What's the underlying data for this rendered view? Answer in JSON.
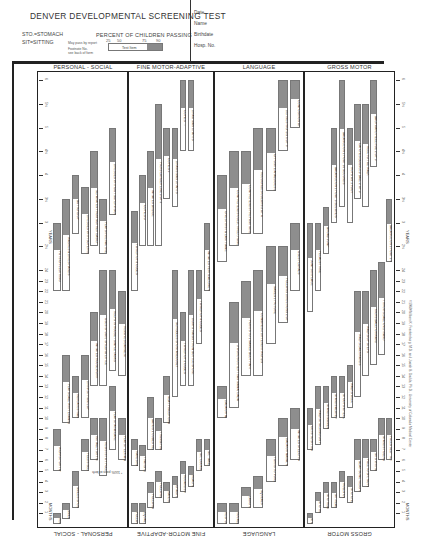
{
  "header": {
    "title": "DENVER DEVELOPMENTAL SCREENING TEST",
    "abbreviations": [
      "STO.=STOMACH",
      "SIT=SITTING"
    ],
    "percent_title": "PERCENT OF CHILDREN PASSING",
    "percent_ticks": [
      "25",
      "50",
      "75",
      "90"
    ],
    "legend_notes": [
      "May pass by report",
      "Footnote No.",
      "see back of form"
    ],
    "legend_item_label": "Test Item",
    "meta_fields": [
      "Date",
      "Name",
      "Birthdate",
      "Hosp. No."
    ]
  },
  "sections": [
    {
      "id": "personal-social",
      "label": "PERSONAL - SOCIAL"
    },
    {
      "id": "fine-motor-adaptive",
      "label": "FINE MOTOR-ADAPTIVE"
    },
    {
      "id": "language",
      "label": "LANGUAGE"
    },
    {
      "id": "gross-motor",
      "label": "GROSS MOTOR"
    }
  ],
  "axis": {
    "months_label": "MONTHS",
    "years_label": "YEARS",
    "ticks": [
      "1",
      "2",
      "3",
      "4",
      "5",
      "6",
      "7",
      "8",
      "9",
      "10",
      "11",
      "12",
      "13",
      "14",
      "15",
      "16",
      "17",
      "18",
      "19",
      "20",
      "21",
      "22",
      "23",
      "24",
      "2½",
      "3",
      "3½",
      "4",
      "4½",
      "5",
      "5½",
      "6"
    ]
  },
  "footnotes": {
    "ps_note": "* 100% pass at birth",
    "copyright": "©1969 William K. Frankenburg, M.D. and Josiah B. Dodds, Ph.D., University of Colorado Medical Center"
  },
  "colors": {
    "bar_fill": "#8e8e8e",
    "bar_border": "#777777",
    "rule": "#222222",
    "paper": "#ffffff"
  },
  "chart_data": {
    "type": "bar",
    "title": "DENVER DEVELOPMENTAL SCREENING TEST",
    "orientation": "rotated; age axis runs bottom (birth) to top (6 years)",
    "xlabel": "Age (months / years)",
    "ylabel": "Percent of children passing (25, 50, 75, 90)",
    "age_range_months": [
      0,
      72
    ],
    "series": [
      {
        "name": "PERSONAL-SOCIAL",
        "items": [
          {
            "label": "REGARDS FACE",
            "start": 0,
            "p90": 1
          },
          {
            "label": "SMILES RESPONSIVELY",
            "start": 0.5,
            "p90": 2
          },
          {
            "label": "SMILES SPONTANEOUSLY",
            "start": 1.5,
            "p90": 5
          },
          {
            "label": "FEEDS SELF CRACKERS",
            "start": 5,
            "p90": 8
          },
          {
            "label": "INITIALLY SHY WITH STRANGERS",
            "start": 6,
            "p90": 10
          },
          {
            "label": "RESISTS TOY PULL",
            "start": 4.5,
            "p90": 10
          },
          {
            "label": "PLAYS PAT-A-CAKE",
            "start": 7,
            "p90": 13
          },
          {
            "label": "PLAYS PEEK-A-BOO",
            "start": 6,
            "p90": 10
          },
          {
            "label": "WORKS FOR TOY OUT OF REACH",
            "start": 5,
            "p90": 9
          },
          {
            "label": "PLAYS BALL WITH EXAMINER",
            "start": 9.5,
            "p90": 16
          },
          {
            "label": "INDICATES WANTS (NOT CRY)",
            "start": 10,
            "p90": 14
          },
          {
            "label": "DRINKS FROM CUP",
            "start": 10,
            "p90": 16
          },
          {
            "label": "IMITATES HOUSEWORK",
            "start": 13,
            "p90": 20
          },
          {
            "label": "USES SPOON, SPILLING LITTLE",
            "start": 13,
            "p90": 24
          },
          {
            "label": "HELPS IN HOUSE - SIMPLE TASKS",
            "start": 14.5,
            "p90": 24
          },
          {
            "label": "REMOVES GARMENT",
            "start": 14,
            "p90": 22
          },
          {
            "label": "PUTS ON CLOTHING",
            "start": 22,
            "p90": 36
          },
          {
            "label": "WASHES & DRIES HANDS",
            "start": 22,
            "p90": 42
          },
          {
            "label": "BUTTONS UP",
            "start": 33,
            "p90": 48
          },
          {
            "label": "DRESSES WITH SUPERVISION",
            "start": 28,
            "p90": 45
          },
          {
            "label": "SEPARATES FROM MOTHER EASILY",
            "start": 30,
            "p90": 54
          },
          {
            "label": "PLAYS INTERACTIVE GAMES I.E. TAG",
            "start": 28,
            "p90": 42
          },
          {
            "label": "DRESSES WITHOUT SUPERVISION",
            "start": 38,
            "p90": 60
          }
        ]
      },
      {
        "name": "FINE MOTOR-ADAPTIVE",
        "items": [
          {
            "label": "FOLLOWS TO MIDLINE",
            "start": 0,
            "p90": 2
          },
          {
            "label": "EQUAL MOVEMENTS",
            "start": 0,
            "p90": 2
          },
          {
            "label": "FOLLOWS PAST MIDLINE",
            "start": 1.5,
            "p90": 4
          },
          {
            "label": "FOLLOWS 180°",
            "start": 2.5,
            "p90": 5
          },
          {
            "label": "HANDS TOGETHER",
            "start": 2,
            "p90": 4
          },
          {
            "label": "GRASPS RATTLE",
            "start": 2.5,
            "p90": 4.5
          },
          {
            "label": "REGARDS RAISIN",
            "start": 3,
            "p90": 6
          },
          {
            "label": "REACHES FOR OBJECT",
            "start": 3.5,
            "p90": 5.5
          },
          {
            "label": "SIT, LOOKS FOR YARN",
            "start": 5,
            "p90": 8
          },
          {
            "label": "SIT, TAKES 2 CUBES",
            "start": 5.5,
            "p90": 8
          },
          {
            "label": "RAKES RAISIN, ATTAINS",
            "start": 5.5,
            "p90": 8
          },
          {
            "label": "TRANSFERS CUBE HAND TO HAND",
            "start": 5,
            "p90": 7.5
          },
          {
            "label": "BANGS 2 CUBES HELD IN HANDS",
            "start": 7,
            "p90": 12
          },
          {
            "label": "THUMB-FINGER GRASP",
            "start": 7,
            "p90": 10
          },
          {
            "label": "NEAT PINCER GRASP OF RAISIN",
            "start": 9.5,
            "p90": 14
          },
          {
            "label": "SCRIBBLES SPONTANEOUSLY",
            "start": 12,
            "p90": 24
          },
          {
            "label": "TOWER OF 2 CUBES",
            "start": 13,
            "p90": 20
          },
          {
            "label": "DUMPS RAISIN FROM BOTTLE-SPONT.",
            "start": 13,
            "p90": 24
          },
          {
            "label": "TOWER OF 4 CUBES",
            "start": 17,
            "p90": 24
          },
          {
            "label": "IMITATES VERTICAL LINE WITHIN 30°",
            "start": 22,
            "p90": 36
          },
          {
            "label": "TOWER OF 8 CUBES",
            "start": 22,
            "p90": 39
          },
          {
            "label": "COPIES O",
            "start": 30,
            "p90": 48
          },
          {
            "label": "IMITATES BRIDGE",
            "start": 30,
            "p90": 54
          },
          {
            "label": "PICKS LONGER LINE 3 OF 3",
            "start": 30,
            "p90": 66
          },
          {
            "label": "COPIES +",
            "start": 42,
            "p90": 60
          },
          {
            "label": "DRAWS MAN 3 PARTS",
            "start": 40,
            "p90": 60
          },
          {
            "label": "COPIES □",
            "start": 54,
            "p90": 72
          },
          {
            "label": "DRAW MAN 6 PARTS",
            "start": 54,
            "p90": 72
          }
        ]
      },
      {
        "name": "LANGUAGE",
        "items": [
          {
            "label": "RESPONDS TO BELL",
            "start": 0,
            "p90": 2
          },
          {
            "label": "VOCALIZES, NOT CRYING",
            "start": 0,
            "p90": 2
          },
          {
            "label": "LAUGHS",
            "start": 1.5,
            "p90": 3.5
          },
          {
            "label": "SQUEALS",
            "start": 1.5,
            "p90": 4.5
          },
          {
            "label": "TURNS TO VOICE",
            "start": 4,
            "p90": 8
          },
          {
            "label": "DADA OR MAMA, NONSPECIFIC",
            "start": 5.5,
            "p90": 10
          },
          {
            "label": "IMITATES SPEECH SOUNDS",
            "start": 6,
            "p90": 11
          },
          {
            "label": "DADA OR MAMA, SPECIFIC",
            "start": 10,
            "p90": 13
          },
          {
            "label": "3 WORDS OTHER THAN MAMA, DADA",
            "start": 11,
            "p90": 21
          },
          {
            "label": "POINTS TO 1 NAMED BODY PART",
            "start": 14,
            "p90": 23
          },
          {
            "label": "COMBINES 2 DIFFERENT WORDS",
            "start": 14,
            "p90": 24
          },
          {
            "label": "NAMES 1 PICTURE",
            "start": 17,
            "p90": 30
          },
          {
            "label": "FOLLOWS DIRECTIONS 2 OF 3",
            "start": 19,
            "p90": 30
          },
          {
            "label": "USES PLURALS",
            "start": 22,
            "p90": 36
          },
          {
            "label": "GIVES FIRST & LAST NAME",
            "start": 26,
            "p90": 48
          },
          {
            "label": "COMPREHENDS COLD, TIRED, HUNGRY",
            "start": 30,
            "p90": 54
          },
          {
            "label": "COMPREHENDS PREPOSITIONS",
            "start": 33,
            "p90": 54
          },
          {
            "label": "RECOGNIZES COLORS 3 OF 4",
            "start": 33,
            "p90": 60
          },
          {
            "label": "OPPOSITE ANALOGIES 2 OF 3",
            "start": 44,
            "p90": 60
          },
          {
            "label": "DEFINES WORDS 6 OF 9",
            "start": 54,
            "p90": 72
          },
          {
            "label": "COMPOSITION OF 3 OF 3",
            "start": 60,
            "p90": 72
          }
        ]
      },
      {
        "name": "GROSS MOTOR",
        "items": [
          {
            "label": "STO. LIFTS HEAD",
            "start": 0,
            "p90": 1
          },
          {
            "label": "STO. HEAD UP 45°",
            "start": 1,
            "p90": 3
          },
          {
            "label": "STO. HEAD UP 90°",
            "start": 1.5,
            "p90": 4
          },
          {
            "label": "SIT-HEAD STEADY",
            "start": 1.5,
            "p90": 4
          },
          {
            "label": "ROLLS OVER",
            "start": 2.5,
            "p90": 5
          },
          {
            "label": "STO. CHEST UP-ARM SUPPORT",
            "start": 2,
            "p90": 4.5
          },
          {
            "label": "BEAR SOME WEIGHT ON LEGS",
            "start": 3,
            "p90": 8
          },
          {
            "label": "PULL TO SIT, NO HEAD LAG",
            "start": 3.5,
            "p90": 8
          },
          {
            "label": "SITS WITHOUT SUPPORT",
            "start": 5,
            "p90": 8
          },
          {
            "label": "STANDS HOLDING ON",
            "start": 6,
            "p90": 10
          },
          {
            "label": "PULLS SELF TO STAND",
            "start": 6,
            "p90": 10
          },
          {
            "label": "GETS TO SITTING",
            "start": 7,
            "p90": 11
          },
          {
            "label": "WALKS HOLDING ON FURNITURE",
            "start": 7.5,
            "p90": 13
          },
          {
            "label": "STANDS MOMENTARILY",
            "start": 9,
            "p90": 13
          },
          {
            "label": "STANDS ALONE WELL",
            "start": 10,
            "p90": 14
          },
          {
            "label": "STOOPS & RECOVERS",
            "start": 10,
            "p90": 14
          },
          {
            "label": "WALKS WELL",
            "start": 11,
            "p90": 15
          },
          {
            "label": "WALKS BACKWARDS",
            "start": 12,
            "p90": 22
          },
          {
            "label": "WALKS UP STEPS",
            "start": 14,
            "p90": 22
          },
          {
            "label": "KICKS BALL FORWARD",
            "start": 15,
            "p90": 24
          },
          {
            "label": "THROWS BALL OVERHAND",
            "start": 16,
            "p90": 26
          },
          {
            "label": "BALANCE ON 1 FOOT 1 SECOND",
            "start": 26,
            "p90": 42
          },
          {
            "label": "JUMPS IN PLACE",
            "start": 20,
            "p90": 36
          },
          {
            "label": "PEDALS TRIKE",
            "start": 22,
            "p90": 36
          },
          {
            "label": "BROAD JUMP",
            "start": 28,
            "p90": 40
          },
          {
            "label": "BALANCE ON 1 FOOT 5 SECONDS",
            "start": 36,
            "p90": 60
          },
          {
            "label": "BALANCE ON 1 FOOT 10 SECONDS",
            "start": 40,
            "p90": 72
          },
          {
            "label": "HOPS ON 1 FOOT",
            "start": 36,
            "p90": 60
          },
          {
            "label": "CATCHES BOUNCED BALL 2 OF 3",
            "start": 42,
            "p90": 66
          },
          {
            "label": "HEEL TO TOE WALK",
            "start": 40,
            "p90": 66
          },
          {
            "label": "BACKWARD HEEL-TOE 2 OF 3",
            "start": 50,
            "p90": 72
          }
        ]
      }
    ]
  }
}
